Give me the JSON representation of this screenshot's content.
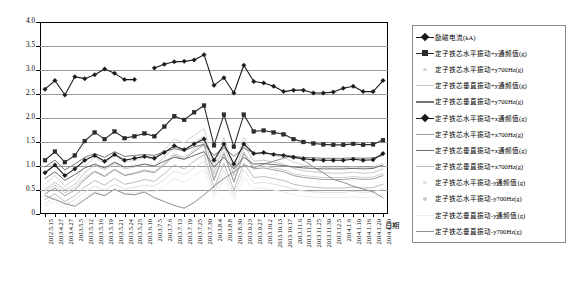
{
  "chart_data": {
    "type": "line",
    "title": "",
    "xlabel": "日期",
    "ylabel": "",
    "ylim": [
      0,
      4.0
    ],
    "yticks": [
      "0",
      "0.5",
      "1.0",
      "1.5",
      "2.0",
      "2.5",
      "3.0",
      "3.5",
      "4.0"
    ],
    "ytick_values": [
      0,
      0.5,
      1.0,
      1.5,
      2.0,
      2.5,
      3.0,
      3.5,
      4.0
    ],
    "grid": "horizontal",
    "legend_position": "right",
    "categories": [
      "2012.5.15",
      "2013.4.27",
      "2013.4.27",
      "2013.5.5",
      "2013.5.12",
      "2013.5.16",
      "2013.5.19",
      "2013.5.21",
      "2013.5.24",
      "2013.5.25",
      "2013.6.10",
      "2013.7.5",
      "2013.7.6",
      "2013.7.13",
      "2013.7.19",
      "2013.7.25",
      "2013.7.30",
      "2013.8.4",
      "2013.8.8",
      "2013.8.30",
      "2013.9.23",
      "2013.9.27",
      "2013.10.2",
      "2013.10.13",
      "2013.10.17",
      "2013.11.6",
      "2013.11.20",
      "2013.11.25",
      "2013.11.30",
      "2013.12.5",
      "2014.1.6",
      "2014.1.10",
      "2014.1.16",
      "2014.1.20",
      "2014.4.10"
    ],
    "series": [
      {
        "name": "励磁电流(kA)",
        "marker": "diamond",
        "color": "#1a1a1a",
        "width": 1.1,
        "values": [
          2.6,
          2.78,
          2.48,
          2.86,
          2.82,
          2.9,
          3.02,
          2.93,
          2.8,
          2.8,
          null,
          3.04,
          3.12,
          3.17,
          3.18,
          3.21,
          3.32,
          2.68,
          2.84,
          2.52,
          3.1,
          2.76,
          2.73,
          2.66,
          2.55,
          2.58,
          2.58,
          2.52,
          2.52,
          2.54,
          2.62,
          2.66,
          2.55,
          2.55,
          2.78
        ]
      },
      {
        "name": "定子铁芯水平振动+y通频值(g)",
        "marker": "square",
        "color": "#2b2b2b",
        "width": 1.1,
        "values": [
          1.12,
          1.3,
          1.08,
          1.22,
          1.52,
          1.7,
          1.56,
          1.72,
          1.58,
          1.62,
          1.68,
          1.62,
          1.82,
          2.04,
          1.96,
          2.12,
          2.26,
          1.43,
          2.07,
          1.4,
          2.07,
          1.72,
          1.74,
          1.7,
          1.66,
          1.56,
          1.5,
          1.47,
          1.45,
          1.44,
          1.44,
          1.46,
          1.44,
          1.45,
          1.54
        ]
      },
      {
        "name": "定子铁芯水平振动+y700Hz(g)",
        "marker": "none",
        "color": "#d5d5d5",
        "width": 1.0,
        "values": [
          0.62,
          0.8,
          0.58,
          0.72,
          1.0,
          1.18,
          1.06,
          1.22,
          1.08,
          1.12,
          1.18,
          1.14,
          1.34,
          1.56,
          1.48,
          1.64,
          1.78,
          0.95,
          1.6,
          0.92,
          1.6,
          1.24,
          1.26,
          1.22,
          1.18,
          1.08,
          1.02,
          0.99,
          0.97,
          0.96,
          0.96,
          0.98,
          0.96,
          0.97,
          1.06
        ]
      },
      {
        "name": "定子铁芯垂直振动+y通频值(g)",
        "marker": "none",
        "color": "#c8c8c8",
        "width": 1.0,
        "values": [
          0.52,
          0.66,
          0.5,
          0.62,
          0.86,
          1.02,
          0.92,
          1.06,
          0.94,
          0.98,
          1.04,
          1.0,
          1.18,
          1.4,
          1.32,
          1.48,
          1.62,
          0.84,
          1.44,
          0.8,
          1.44,
          1.1,
          1.12,
          1.08,
          1.04,
          0.95,
          0.9,
          0.88,
          0.86,
          0.85,
          0.85,
          0.87,
          0.85,
          0.86,
          0.94
        ]
      },
      {
        "name": "定子铁芯垂直振动+y700Hz(g)",
        "marker": "none",
        "color": "#777777",
        "width": 1.0,
        "values": [
          0.98,
          1.12,
          0.92,
          1.04,
          1.18,
          1.26,
          1.18,
          1.3,
          1.2,
          1.22,
          1.24,
          1.22,
          1.3,
          1.36,
          1.32,
          1.4,
          1.45,
          1.22,
          1.38,
          1.2,
          1.38,
          1.26,
          1.27,
          1.25,
          1.23,
          1.2,
          1.18,
          1.17,
          1.16,
          1.16,
          1.16,
          1.17,
          1.16,
          1.17,
          1.22
        ]
      },
      {
        "name": "定子铁芯水平振动+x通频值(g)",
        "marker": "diamond",
        "color": "#1a1a1a",
        "width": 1.1,
        "values": [
          0.86,
          1.02,
          0.8,
          0.94,
          1.12,
          1.22,
          1.1,
          1.24,
          1.12,
          1.16,
          1.2,
          1.16,
          1.28,
          1.42,
          1.34,
          1.46,
          1.56,
          1.12,
          1.46,
          1.04,
          1.46,
          1.26,
          1.28,
          1.24,
          1.22,
          1.18,
          1.15,
          1.13,
          1.12,
          1.12,
          1.12,
          1.14,
          1.12,
          1.13,
          1.26
        ]
      },
      {
        "name": "定子铁芯水平振动+x700Hz(g)",
        "marker": "none",
        "color": "#9f9f9f",
        "width": 1.0,
        "values": [
          0.42,
          0.54,
          0.38,
          0.5,
          0.72,
          0.88,
          0.78,
          0.92,
          0.8,
          0.84,
          0.9,
          0.86,
          1.02,
          1.22,
          1.14,
          1.3,
          1.44,
          0.7,
          1.26,
          0.66,
          1.26,
          0.94,
          0.96,
          0.92,
          0.88,
          0.8,
          0.76,
          0.74,
          0.72,
          0.72,
          0.72,
          0.74,
          0.72,
          0.73,
          0.8
        ]
      },
      {
        "name": "定子铁芯垂直振动+x通频值(g)",
        "marker": "none",
        "color": "#6d6d6d",
        "width": 1.0,
        "values": [
          0.74,
          0.88,
          0.7,
          0.82,
          0.96,
          1.04,
          0.96,
          1.08,
          0.98,
          1.0,
          1.04,
          1.0,
          1.1,
          1.18,
          1.14,
          1.22,
          1.3,
          0.98,
          1.18,
          0.94,
          1.18,
          1.04,
          1.05,
          1.03,
          1.01,
          0.98,
          0.96,
          0.95,
          0.94,
          0.94,
          0.94,
          0.95,
          0.94,
          0.95,
          1.02
        ]
      },
      {
        "name": "定子铁芯垂直振动+x700Hz(g)",
        "marker": "none",
        "color": "#bdbdbd",
        "width": 1.0,
        "values": [
          0.3,
          0.42,
          0.26,
          0.38,
          0.56,
          0.7,
          0.6,
          0.74,
          0.62,
          0.66,
          0.72,
          0.68,
          0.84,
          1.02,
          0.94,
          1.1,
          1.24,
          0.54,
          1.06,
          0.5,
          1.06,
          0.76,
          0.78,
          0.74,
          0.7,
          0.62,
          0.58,
          0.56,
          0.54,
          0.54,
          0.54,
          0.56,
          0.54,
          0.55,
          0.62
        ]
      },
      {
        "name": "定子铁芯水平振动-y通频值(g)",
        "marker": "none",
        "color": "#e0e0e0",
        "width": 1.0,
        "values": [
          0.22,
          0.34,
          0.18,
          0.3,
          0.46,
          0.58,
          0.5,
          0.62,
          0.52,
          0.56,
          0.6,
          0.58,
          0.72,
          0.9,
          0.82,
          0.96,
          1.1,
          0.44,
          0.92,
          0.4,
          0.92,
          0.64,
          0.66,
          0.62,
          0.58,
          0.52,
          0.48,
          0.46,
          0.45,
          0.45,
          0.45,
          0.47,
          0.45,
          0.46,
          0.52
        ]
      },
      {
        "name": "定子铁芯水平振动-y700Hz(g)",
        "marker": "none",
        "color": "#cfcfcf",
        "width": 1.0,
        "values": [
          0.48,
          0.6,
          0.44,
          0.56,
          0.76,
          0.9,
          0.8,
          0.94,
          0.82,
          0.86,
          0.92,
          0.88,
          1.06,
          1.26,
          1.18,
          1.34,
          1.48,
          0.74,
          1.3,
          0.7,
          1.3,
          0.98,
          1.0,
          0.96,
          0.92,
          0.84,
          0.8,
          0.78,
          0.76,
          0.76,
          0.76,
          0.78,
          0.76,
          0.77,
          0.84
        ]
      },
      {
        "name": "定子铁芯垂直振动-y通频值(g)",
        "marker": "none",
        "color": "#ededed",
        "width": 1.0,
        "values": [
          0.16,
          0.26,
          0.12,
          0.22,
          0.36,
          0.46,
          0.4,
          0.5,
          0.42,
          0.44,
          0.48,
          0.46,
          0.58,
          0.74,
          0.66,
          0.8,
          0.92,
          0.34,
          0.76,
          0.3,
          0.76,
          0.52,
          0.54,
          0.5,
          0.46,
          0.4,
          0.37,
          0.35,
          0.34,
          0.34,
          0.34,
          0.36,
          0.34,
          0.35,
          0.4
        ]
      },
      {
        "name": "定子铁芯垂直振动-y700Hz(g)",
        "marker": "none",
        "color": "#8e8e8e",
        "width": 1.0,
        "values": [
          0.38,
          0.3,
          0.22,
          0.16,
          0.3,
          0.44,
          0.38,
          0.52,
          0.42,
          0.4,
          0.46,
          0.34,
          0.26,
          0.18,
          0.12,
          0.24,
          0.4,
          0.58,
          0.74,
          0.88,
          1.02,
          0.96,
          1.04,
          1.1,
          1.16,
          1.22,
          1.12,
          0.98,
          0.86,
          0.72,
          0.66,
          0.58,
          0.52,
          0.46,
          0.34
        ]
      }
    ]
  },
  "legend": {
    "items": [
      {
        "label": "励磁电流(kA)",
        "marker": "diamond",
        "color": "#1a1a1a"
      },
      {
        "label": "定子铁芯水平振动+y通频值(g)",
        "marker": "square",
        "color": "#2b2b2b"
      },
      {
        "label": "定子铁芯水平振动+y700Hz(g)",
        "marker": "dot",
        "color": "#d5d5d5"
      },
      {
        "label": "定子铁芯垂直振动+y通频值(g)",
        "marker": "none",
        "color": "#c8c8c8"
      },
      {
        "label": "定子铁芯垂直振动+y700Hz(g)",
        "marker": "none",
        "color": "#777777"
      },
      {
        "label": "定子铁芯水平振动+x通频值(g)",
        "marker": "diamond",
        "color": "#1a1a1a"
      },
      {
        "label": "定子铁芯水平振动+x700Hz(g)",
        "marker": "none",
        "color": "#9f9f9f"
      },
      {
        "label": "定子铁芯垂直振动+x通频值(g)",
        "marker": "none",
        "color": "#6d6d6d"
      },
      {
        "label": "定子铁芯垂直振动+x700Hz(g)",
        "marker": "none",
        "color": "#bdbdbd"
      },
      {
        "label": "定子铁芯水平振动-y通频值(g)",
        "marker": "dot",
        "color": "#e0e0e0"
      },
      {
        "label": "定子铁芯水平振动-y700Hz(g)",
        "marker": "dot",
        "color": "#cfcfcf"
      },
      {
        "label": "定子铁芯垂直振动-y通频值(g)",
        "marker": "none",
        "color": "#ededed"
      },
      {
        "label": "定子铁芯垂直振动-y700Hz(g)",
        "marker": "none",
        "color": "#8e8e8e"
      }
    ]
  },
  "colors": {
    "grid": "#9a9a9a",
    "frame": "#000000",
    "legend_border": "#8a8a8a",
    "background": "#ffffff"
  }
}
